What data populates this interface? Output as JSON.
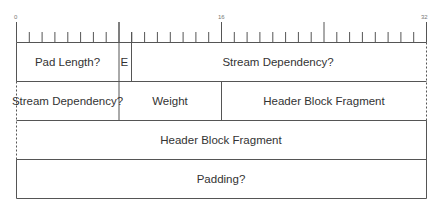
{
  "diagram": {
    "type": "packet-frame-layout",
    "ruler": {
      "bit_labels": [
        {
          "bit": 0,
          "label": "0"
        },
        {
          "bit": 16,
          "label": "16"
        },
        {
          "bit": 32,
          "label": "32"
        }
      ],
      "total_bits": 32
    },
    "rows": [
      {
        "fields": [
          {
            "label": "Pad Length?",
            "start": 0,
            "end": 8
          },
          {
            "label": "E",
            "start": 8,
            "end": 9
          },
          {
            "label": "Stream Dependency?",
            "start": 9,
            "end": 32
          }
        ]
      },
      {
        "fields": [
          {
            "label": "Stream Dependency?",
            "start": 0,
            "end": 8
          },
          {
            "label": "Weight",
            "start": 8,
            "end": 16
          },
          {
            "label": "Header Block Fragment",
            "start": 16,
            "end": 32
          }
        ]
      },
      {
        "fields": [
          {
            "label": "Header Block Fragment",
            "start": 0,
            "end": 32
          }
        ]
      },
      {
        "fields": [
          {
            "label": "Padding?",
            "start": 0,
            "end": 32
          }
        ]
      }
    ],
    "colors": {
      "line": "#555555",
      "text": "#333333",
      "background": "#ffffff"
    }
  }
}
